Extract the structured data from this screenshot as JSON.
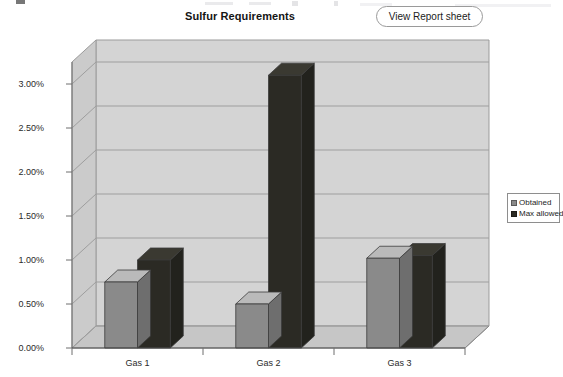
{
  "header": {
    "title": "Sulfur Requirements",
    "button_label": "View Report sheet"
  },
  "legend": {
    "items": [
      {
        "label": "Obtained",
        "color": "#8a8a8a",
        "icon": "square-swatch-icon"
      },
      {
        "label": "Max allowed",
        "color": "#2b2a24",
        "icon": "square-swatch-icon"
      }
    ]
  },
  "chart_data": {
    "type": "bar",
    "title": "Sulfur Requirements",
    "xlabel": "",
    "ylabel": "",
    "categories": [
      "Gas 1",
      "Gas 2",
      "Gas 3"
    ],
    "series": [
      {
        "name": "Obtained",
        "color": "#8a8a8a",
        "values": [
          0.75,
          0.5,
          1.02
        ]
      },
      {
        "name": "Max allowed",
        "color": "#2b2a24",
        "values": [
          1.0,
          3.1,
          1.05
        ]
      }
    ],
    "ylim": [
      0,
      3.25
    ],
    "ytick_labels": [
      "0.00%",
      "0.50%",
      "1.00%",
      "1.50%",
      "2.00%",
      "2.50%",
      "3.00%"
    ],
    "ytick_values": [
      0,
      0.5,
      1.0,
      1.5,
      2.0,
      2.5,
      3.0
    ],
    "grid": true,
    "legend_position": "right",
    "three_d": true,
    "value_format": "percent"
  }
}
